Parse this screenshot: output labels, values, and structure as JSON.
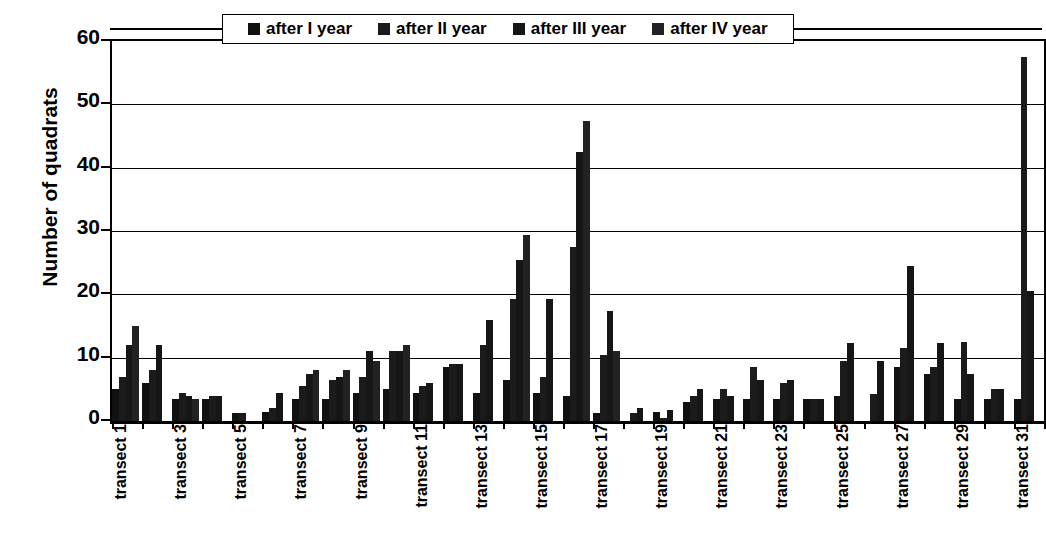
{
  "chart_data": {
    "type": "bar",
    "title": "",
    "xlabel": "",
    "ylabel": "Number of quadrats",
    "ylim": [
      0,
      60
    ],
    "yticks": [
      0,
      10,
      20,
      30,
      40,
      50,
      60
    ],
    "grid": true,
    "legend_position": "top-center",
    "categories": [
      "transect 1",
      "transect 2",
      "transect 3",
      "transect 4",
      "transect 5",
      "transect 6",
      "transect 7",
      "transect 8",
      "transect 9",
      "transect 10",
      "transect 11",
      "transect 12",
      "transect 13",
      "transect 14",
      "transect 15",
      "transect 16",
      "transect 17",
      "transect 18",
      "transect 19",
      "transect 20",
      "transect 21",
      "transect 22",
      "transect 23",
      "transect 24",
      "transect 25",
      "transect 26",
      "transect 27",
      "transect 28",
      "transect 29",
      "transect 30",
      "transect 31"
    ],
    "tick_labels_shown": [
      "transect 1",
      "transect 3",
      "transect 5",
      "transect 7",
      "transect 9",
      "transect 11",
      "transect 13",
      "transect 15",
      "transect 17",
      "transect 19",
      "transect 21",
      "transect 23",
      "transect 25",
      "transect 27",
      "transect 29",
      "transect 31"
    ],
    "series": [
      {
        "name": "after I year",
        "color": "#111111",
        "values": [
          5,
          6,
          3.5,
          3.5,
          1.2,
          1.5,
          3.5,
          3.5,
          4.5,
          5,
          4.5,
          8.5,
          4.5,
          6.5,
          4.5,
          4,
          1.3,
          0,
          1.5,
          3,
          3.5,
          3.5,
          3.5,
          3.5,
          4,
          0,
          8.5,
          7.5,
          3.5,
          3.5,
          3.5
        ]
      },
      {
        "name": "after II year",
        "color": "#1b1b1b",
        "values": [
          7,
          8,
          4.5,
          4,
          1.2,
          2,
          5.5,
          6.5,
          7,
          11,
          5.5,
          9,
          12,
          19.3,
          7,
          27.5,
          10.5,
          1.3,
          0.5,
          4,
          5,
          8.5,
          6,
          3.5,
          9.5,
          4.3,
          11.5,
          8.5,
          12.5,
          5,
          57.5
        ]
      },
      {
        "name": "after III year",
        "color": "#161616",
        "values": [
          12,
          12,
          4,
          4,
          0,
          4.5,
          7.5,
          7,
          11,
          11,
          6,
          9,
          16,
          25.5,
          19.3,
          42.5,
          17.3,
          2,
          1.8,
          5,
          4,
          6.5,
          6.5,
          3.5,
          12.3,
          9.5,
          24.5,
          12.3,
          7.5,
          5,
          20.5
        ]
      },
      {
        "name": "after IV year",
        "color": "#222222",
        "values": [
          15,
          0,
          3.5,
          0,
          0,
          0,
          8,
          8,
          9.5,
          12,
          0,
          0,
          0,
          29.3,
          0,
          47.3,
          11,
          0,
          0,
          0,
          0,
          0,
          0,
          0,
          0,
          0,
          0,
          0,
          0,
          0,
          0
        ]
      }
    ]
  },
  "legend": {
    "items": [
      {
        "label": "after I year",
        "swatch": "legend-swatch-1"
      },
      {
        "label": "after II year",
        "swatch": "legend-swatch-2"
      },
      {
        "label": "after III year",
        "swatch": "legend-swatch-3"
      },
      {
        "label": "after IV year",
        "swatch": "legend-swatch-4"
      }
    ]
  },
  "axes": {
    "y_title": "Number of quadrats",
    "y_tick_labels": [
      "60",
      "50",
      "40",
      "30",
      "20",
      "10",
      "0"
    ]
  }
}
